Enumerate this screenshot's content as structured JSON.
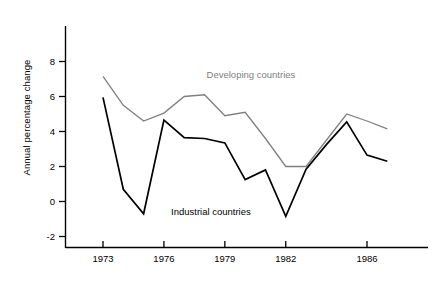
{
  "chart_data": {
    "type": "line",
    "title": "",
    "xlabel": "",
    "ylabel": "Annual percentage change",
    "xlim": [
      1972,
      1987.6
    ],
    "ylim": [
      -2.6,
      8.2
    ],
    "grid": false,
    "legend": "inline-annotations",
    "x_ticks": [
      1973,
      1976,
      1979,
      1982,
      1986
    ],
    "x_tick_labels": [
      "1973",
      "1976",
      "1979",
      "1982",
      "1986"
    ],
    "y_ticks": [
      -2,
      0,
      2,
      4,
      6,
      8
    ],
    "y_tick_labels": [
      "-2",
      "0",
      "2",
      "4",
      "6",
      "8"
    ],
    "x": [
      1973,
      1974,
      1975,
      1976,
      1977,
      1978,
      1979,
      1980,
      1981,
      1982,
      1983,
      1984,
      1985,
      1986,
      1987
    ],
    "series": [
      {
        "name": "Developing countries",
        "color": "#7f7f7f",
        "label_x": 1978.1,
        "label_y": 7.05,
        "values": [
          7.15,
          5.5,
          4.6,
          5.05,
          6.0,
          6.1,
          4.9,
          5.1,
          3.6,
          2.0,
          2.0,
          3.5,
          5.0,
          4.6,
          4.15
        ]
      },
      {
        "name": "Industrial countries",
        "color": "#000000",
        "label_x": 1976.35,
        "label_y": -0.75,
        "values": [
          5.95,
          0.7,
          -0.7,
          4.65,
          3.65,
          3.6,
          3.35,
          1.25,
          1.8,
          -0.85,
          1.85,
          3.25,
          4.55,
          2.65,
          2.3
        ]
      }
    ]
  }
}
